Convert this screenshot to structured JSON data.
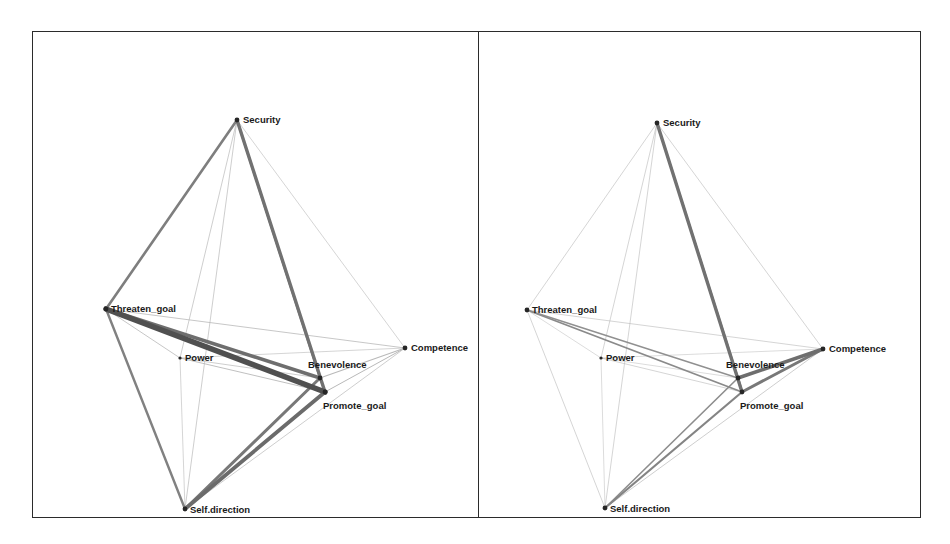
{
  "figure": {
    "title": "",
    "panel_count": 2,
    "background_color": "#ffffff",
    "frame_color": "#2b2b2b"
  },
  "chart_data": {
    "type": "scatter",
    "subtype": "network-graph",
    "title": "",
    "xlabel": "",
    "ylabel": "",
    "grid": false,
    "legend": "none",
    "node_color": "#262626",
    "edge_color_strong": "#4d4d4d",
    "edge_color_weak": "#b9b9b9",
    "panels": [
      {
        "name": "left-panel",
        "label": "",
        "nodes": [
          {
            "id": "Security",
            "label": "Security",
            "x": 205,
            "y": 89,
            "label_dx": 6,
            "label_dy": 0,
            "anchor": "start"
          },
          {
            "id": "Threaten_goal",
            "label": "Threaten_goal",
            "x": 74,
            "y": 278,
            "label_dx": 5,
            "label_dy": 0,
            "anchor": "start"
          },
          {
            "id": "Power",
            "label": "Power",
            "x": 148,
            "y": 327,
            "label_dx": 5,
            "label_dy": 0,
            "anchor": "start"
          },
          {
            "id": "Competence",
            "label": "Competence",
            "x": 373,
            "y": 317,
            "label_dx": 6,
            "label_dy": 0,
            "anchor": "start"
          },
          {
            "id": "Benevolence",
            "label": "Benevolence",
            "x": 288,
            "y": 347,
            "label_dx": -12,
            "label_dy": -13,
            "anchor": "start"
          },
          {
            "id": "Promote_goal",
            "label": "Promote_goal",
            "x": 293,
            "y": 361,
            "label_dx": -2,
            "label_dy": 14,
            "anchor": "start"
          },
          {
            "id": "Self.direction",
            "label": "Self.direction",
            "x": 153,
            "y": 478,
            "label_dx": 5,
            "label_dy": 1,
            "anchor": "start"
          }
        ],
        "edges": [
          {
            "from": "Security",
            "to": "Threaten_goal",
            "weight": 2.6,
            "tone": "strong"
          },
          {
            "from": "Security",
            "to": "Promote_goal",
            "weight": 3.4,
            "tone": "strong"
          },
          {
            "from": "Security",
            "to": "Benevolence",
            "weight": 2.2,
            "tone": "strong"
          },
          {
            "from": "Security",
            "to": "Power",
            "weight": 0.7,
            "tone": "weak"
          },
          {
            "from": "Security",
            "to": "Self.direction",
            "weight": 0.7,
            "tone": "weak"
          },
          {
            "from": "Security",
            "to": "Competence",
            "weight": 0.6,
            "tone": "weak"
          },
          {
            "from": "Threaten_goal",
            "to": "Promote_goal",
            "weight": 5.6,
            "tone": "strong"
          },
          {
            "from": "Threaten_goal",
            "to": "Benevolence",
            "weight": 3.6,
            "tone": "strong"
          },
          {
            "from": "Threaten_goal",
            "to": "Competence",
            "weight": 0.8,
            "tone": "weak"
          },
          {
            "from": "Threaten_goal",
            "to": "Power",
            "weight": 0.8,
            "tone": "weak"
          },
          {
            "from": "Threaten_goal",
            "to": "Self.direction",
            "weight": 2.4,
            "tone": "strong"
          },
          {
            "from": "Power",
            "to": "Promote_goal",
            "weight": 0.9,
            "tone": "weak"
          },
          {
            "from": "Power",
            "to": "Benevolence",
            "weight": 0.7,
            "tone": "weak"
          },
          {
            "from": "Power",
            "to": "Self.direction",
            "weight": 0.6,
            "tone": "weak"
          },
          {
            "from": "Power",
            "to": "Competence",
            "weight": 0.6,
            "tone": "weak"
          },
          {
            "from": "Competence",
            "to": "Benevolence",
            "weight": 1.1,
            "tone": "weak"
          },
          {
            "from": "Competence",
            "to": "Promote_goal",
            "weight": 1.0,
            "tone": "weak"
          },
          {
            "from": "Competence",
            "to": "Self.direction",
            "weight": 0.7,
            "tone": "weak"
          },
          {
            "from": "Benevolence",
            "to": "Promote_goal",
            "weight": 2.0,
            "tone": "strong"
          },
          {
            "from": "Benevolence",
            "to": "Self.direction",
            "weight": 3.0,
            "tone": "strong"
          },
          {
            "from": "Promote_goal",
            "to": "Self.direction",
            "weight": 3.8,
            "tone": "strong"
          }
        ]
      },
      {
        "name": "right-panel",
        "label": "",
        "nodes": [
          {
            "id": "Security",
            "label": "Security",
            "x": 178,
            "y": 92,
            "label_dx": 6,
            "label_dy": 0,
            "anchor": "start"
          },
          {
            "id": "Threaten_goal",
            "label": "Threaten_goal",
            "x": 48,
            "y": 279,
            "label_dx": 5,
            "label_dy": 0,
            "anchor": "start"
          },
          {
            "id": "Power",
            "label": "Power",
            "x": 122,
            "y": 327,
            "label_dx": 5,
            "label_dy": 0,
            "anchor": "start"
          },
          {
            "id": "Competence",
            "label": "Competence",
            "x": 344,
            "y": 318,
            "label_dx": 6,
            "label_dy": 0,
            "anchor": "start"
          },
          {
            "id": "Benevolence",
            "label": "Benevolence",
            "x": 259,
            "y": 347,
            "label_dx": -12,
            "label_dy": -13,
            "anchor": "start"
          },
          {
            "id": "Promote_goal",
            "label": "Promote_goal",
            "x": 263,
            "y": 361,
            "label_dx": -2,
            "label_dy": 14,
            "anchor": "start"
          },
          {
            "id": "Self.direction",
            "label": "Self.direction",
            "x": 126,
            "y": 477,
            "label_dx": 5,
            "label_dy": 1,
            "anchor": "start"
          }
        ],
        "edges": [
          {
            "from": "Security",
            "to": "Promote_goal",
            "weight": 3.4,
            "tone": "strong"
          },
          {
            "from": "Security",
            "to": "Benevolence",
            "weight": 2.0,
            "tone": "strong"
          },
          {
            "from": "Security",
            "to": "Threaten_goal",
            "weight": 0.6,
            "tone": "weak"
          },
          {
            "from": "Security",
            "to": "Power",
            "weight": 0.6,
            "tone": "weak"
          },
          {
            "from": "Security",
            "to": "Self.direction",
            "weight": 0.6,
            "tone": "weak"
          },
          {
            "from": "Security",
            "to": "Competence",
            "weight": 0.6,
            "tone": "weak"
          },
          {
            "from": "Threaten_goal",
            "to": "Promote_goal",
            "weight": 1.8,
            "tone": "strong"
          },
          {
            "from": "Threaten_goal",
            "to": "Benevolence",
            "weight": 1.4,
            "tone": "strong"
          },
          {
            "from": "Threaten_goal",
            "to": "Competence",
            "weight": 0.6,
            "tone": "weak"
          },
          {
            "from": "Threaten_goal",
            "to": "Power",
            "weight": 0.5,
            "tone": "weak"
          },
          {
            "from": "Threaten_goal",
            "to": "Self.direction",
            "weight": 0.6,
            "tone": "weak"
          },
          {
            "from": "Power",
            "to": "Promote_goal",
            "weight": 0.6,
            "tone": "weak"
          },
          {
            "from": "Power",
            "to": "Benevolence",
            "weight": 0.5,
            "tone": "weak"
          },
          {
            "from": "Power",
            "to": "Self.direction",
            "weight": 0.5,
            "tone": "weak"
          },
          {
            "from": "Power",
            "to": "Competence",
            "weight": 0.5,
            "tone": "weak"
          },
          {
            "from": "Competence",
            "to": "Benevolence",
            "weight": 3.6,
            "tone": "strong"
          },
          {
            "from": "Competence",
            "to": "Promote_goal",
            "weight": 3.0,
            "tone": "strong"
          },
          {
            "from": "Competence",
            "to": "Self.direction",
            "weight": 0.7,
            "tone": "weak"
          },
          {
            "from": "Benevolence",
            "to": "Promote_goal",
            "weight": 2.4,
            "tone": "strong"
          },
          {
            "from": "Benevolence",
            "to": "Self.direction",
            "weight": 1.6,
            "tone": "strong"
          },
          {
            "from": "Promote_goal",
            "to": "Self.direction",
            "weight": 2.2,
            "tone": "strong"
          }
        ]
      }
    ]
  }
}
